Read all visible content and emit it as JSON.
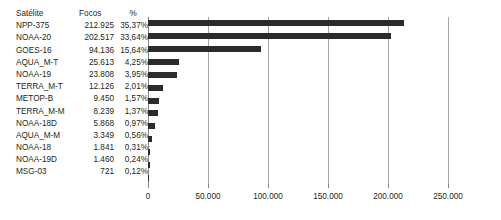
{
  "table": {
    "headers": {
      "satellite": "Satélite",
      "focos": "Focos",
      "percent": "%"
    },
    "rows": [
      {
        "satellite": "NPP-375",
        "focos": "212.925",
        "percent": "35,37%",
        "value": 212925
      },
      {
        "satellite": "NOAA-20",
        "focos": "202.517",
        "percent": "33,64%",
        "value": 202517
      },
      {
        "satellite": "GOES-16",
        "focos": "94.136",
        "percent": "15,64%",
        "value": 94136
      },
      {
        "satellite": "AQUA_M-T",
        "focos": "25.613",
        "percent": "4,25%",
        "value": 25613
      },
      {
        "satellite": "NOAA-19",
        "focos": "23.808",
        "percent": "3,95%",
        "value": 23808
      },
      {
        "satellite": "TERRA_M-T",
        "focos": "12.126",
        "percent": "2,01%",
        "value": 12126
      },
      {
        "satellite": "METOP-B",
        "focos": "9.450",
        "percent": "1,57%",
        "value": 9450
      },
      {
        "satellite": "TERRA_M-M",
        "focos": "8.239",
        "percent": "1,37%",
        "value": 8239
      },
      {
        "satellite": "NOAA-18D",
        "focos": "5.868",
        "percent": "0,97%",
        "value": 5868
      },
      {
        "satellite": "AQUA_M-M",
        "focos": "3.349",
        "percent": "0,56%",
        "value": 3349
      },
      {
        "satellite": "NOAA-18",
        "focos": "1.841",
        "percent": "0,31%",
        "value": 1841
      },
      {
        "satellite": "NOAA-19D",
        "focos": "1.460",
        "percent": "0,24%",
        "value": 1460
      },
      {
        "satellite": "MSG-03",
        "focos": "721",
        "percent": "0,12%",
        "value": 721
      }
    ]
  },
  "chart_data": {
    "type": "bar",
    "orientation": "horizontal",
    "title": "",
    "xlabel": "",
    "ylabel": "",
    "categories": [
      "NPP-375",
      "NOAA-20",
      "GOES-16",
      "AQUA_M-T",
      "NOAA-19",
      "TERRA_M-T",
      "METOP-B",
      "TERRA_M-M",
      "NOAA-18D",
      "AQUA_M-M",
      "NOAA-18",
      "NOAA-19D",
      "MSG-03"
    ],
    "values": [
      212925,
      202517,
      94136,
      25613,
      23808,
      12126,
      9450,
      8239,
      5868,
      3349,
      1841,
      1460,
      721
    ],
    "xlim": [
      0,
      250000
    ],
    "xticks": [
      0,
      50000,
      100000,
      150000,
      200000,
      250000
    ],
    "xticklabels": [
      "0",
      "50.000",
      "100.000",
      "150.000",
      "200.000",
      "250.000"
    ],
    "grid": true,
    "legend": false,
    "bar_color": "#2b2b2b",
    "grid_color": "#a6a6a6"
  }
}
